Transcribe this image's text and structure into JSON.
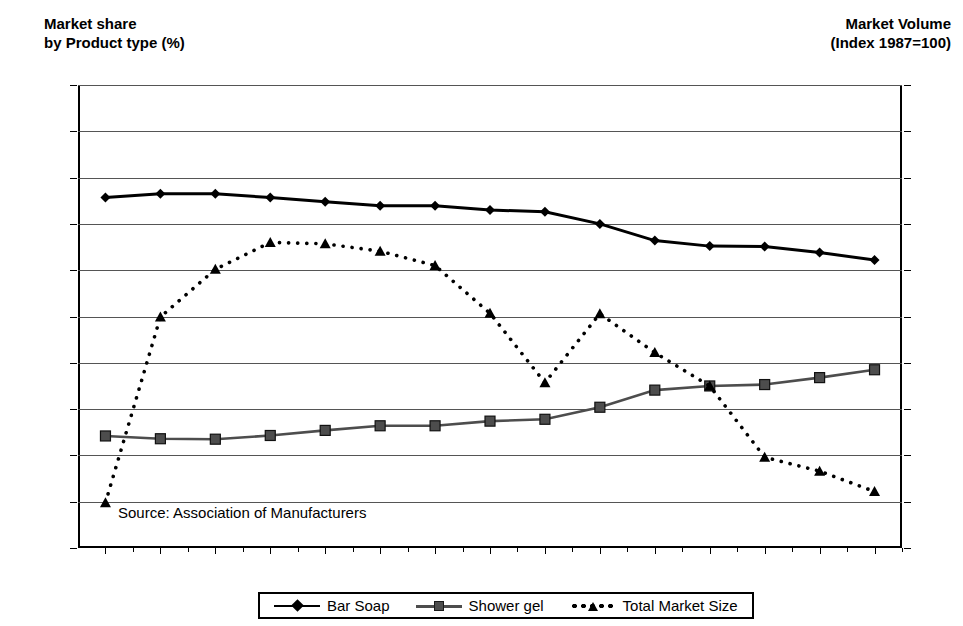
{
  "titles": {
    "left_axis": "Market share\nby Product type  (%)",
    "right_axis": "Market Volume\n(Index 1987=100)"
  },
  "source_note": "Source: Association of Manufacturers",
  "legend": {
    "items": [
      {
        "label": "Bar Soap",
        "marker": "diamond",
        "style": "solid",
        "color": "#000000"
      },
      {
        "label": "Shower gel",
        "marker": "square",
        "style": "solid",
        "color": "#4d4d4d"
      },
      {
        "label": "Total Market Size",
        "marker": "triangle",
        "style": "dotted",
        "color": "#000000"
      }
    ]
  },
  "chart_data": {
    "type": "line",
    "title": "",
    "xlabel": "",
    "ylabel": "Market share by Product type  (%)",
    "y2label": "Market Volume (Index 1987=100)",
    "grid": true,
    "legend_position": "bottom",
    "categories": [
      "1987",
      "1988",
      "1989",
      "1990",
      "1991",
      "1992",
      "1993",
      "1994",
      "1995",
      "1996",
      "1997",
      "1998",
      "1999",
      "2000",
      "2001"
    ],
    "x": [
      1987,
      1988,
      1989,
      1990,
      1991,
      1992,
      1993,
      1994,
      1995,
      1996,
      1997,
      1998,
      1999,
      2000,
      2001
    ],
    "ylim": [
      0,
      100
    ],
    "yticks": [
      0,
      10,
      20,
      30,
      40,
      50,
      60,
      70,
      80,
      90,
      100
    ],
    "ytick_labels": [
      "-",
      "10",
      "20",
      "30",
      "40",
      "50",
      "60",
      "70",
      "80",
      "90",
      "100"
    ],
    "y2lim": [
      98,
      118
    ],
    "y2ticks": [
      98,
      100,
      102,
      104,
      106,
      108,
      110,
      112,
      114,
      116,
      118
    ],
    "y2tick_labels": [
      "98",
      "100",
      "102",
      "104",
      "106",
      "108",
      "110",
      "112",
      "114",
      "116",
      "118"
    ],
    "series": [
      {
        "name": "Bar Soap",
        "axis": "left",
        "marker": "diamond",
        "style": "solid",
        "values": [
          75.7,
          76.5,
          76.5,
          75.7,
          74.8,
          73.9,
          73.9,
          73.0,
          72.6,
          70.0,
          66.4,
          65.2,
          65.1,
          63.8,
          62.2
        ]
      },
      {
        "name": "Shower gel",
        "axis": "left",
        "marker": "square",
        "style": "solid",
        "values": [
          24.2,
          23.6,
          23.5,
          24.3,
          25.4,
          26.4,
          26.4,
          27.4,
          27.8,
          30.4,
          34.1,
          35.0,
          35.3,
          36.8,
          38.5
        ]
      },
      {
        "name": "Total Market Size",
        "axis": "right",
        "marker": "triangle",
        "style": "dotted",
        "values_left_scale": [
          9.8,
          49.9,
          60.2,
          66.0,
          65.7,
          64.1,
          61.0,
          50.7,
          35.7,
          50.6,
          42.2,
          35.0,
          19.6,
          16.6,
          12.2
        ],
        "values": [
          99.96,
          107.98,
          110.04,
          111.2,
          111.14,
          110.82,
          110.2,
          108.14,
          105.14,
          108.12,
          106.44,
          105.0,
          101.92,
          101.32,
          100.44
        ]
      }
    ]
  }
}
